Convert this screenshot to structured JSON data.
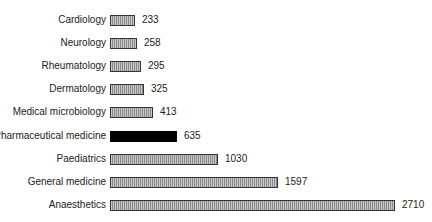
{
  "chart_data": {
    "type": "bar",
    "orientation": "horizontal",
    "title": "",
    "xlabel": "",
    "ylabel": "",
    "grid": false,
    "legend": null,
    "categories": [
      "Cardiology",
      "Neurology",
      "Rheumatology",
      "Dermatology",
      "Medical microbiology",
      "Pharmaceutical medicine",
      "Paediatrics",
      "General medicine",
      "Anaesthetics"
    ],
    "values": [
      233,
      258,
      295,
      325,
      413,
      635,
      1030,
      1597,
      2710
    ],
    "highlighted": "Pharmaceutical medicine",
    "colors": {
      "default_fill": "#b0b0b0",
      "default_pattern": "vertical-hatch",
      "highlight_fill": "#000000",
      "border": "#333333"
    },
    "data_labels": true
  }
}
